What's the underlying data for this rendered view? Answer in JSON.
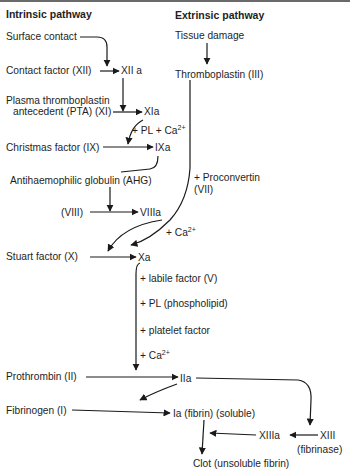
{
  "headers": {
    "intrinsic": "Intrinsic pathway",
    "extrinsic": "Extrinsic pathway"
  },
  "intrinsic": {
    "surface_contact": "Surface contact",
    "contact_factor": "Contact factor (XII)",
    "xii_a": "XII a",
    "pta_line1": "Plasma thromboplastin",
    "pta_line2": "antecedent (PTA) (XI)",
    "xia": "XIa",
    "pl_ca": "+ PL + Ca",
    "pl_ca_sup": "2+",
    "christmas": "Christmas factor (IX)",
    "ixa": "IXa",
    "ahg": "Antihaemophilic globulin (AHG)",
    "viii": "(VIII)",
    "viiia": "VIIIa"
  },
  "extrinsic": {
    "tissue_damage": "Tissue damage",
    "thromboplastin": "Thromboplastin (III)",
    "proconvertin_line1": "+ Proconvertin",
    "proconvertin_line2": "(VII)",
    "ca": "+ Ca",
    "ca_sup": "2+"
  },
  "common": {
    "stuart": "Stuart factor (X)",
    "xa": "Xa",
    "labile": "+ labile factor (V)",
    "pl": "+ PL (phospholipid)",
    "platelet": "+ platelet factor",
    "ca": "+ Ca",
    "ca_sup": "2+",
    "prothrombin": "Prothrombin (II)",
    "iia": "IIa",
    "fibrinogen": "Fibrinogen (I)",
    "ia": "Ia (fibrin) (soluble)",
    "xiiia": "XIIIa",
    "xiii": "XIII",
    "fibrinase": "(fibrinase)",
    "clot": "Clot (unsoluble fibrin)"
  }
}
